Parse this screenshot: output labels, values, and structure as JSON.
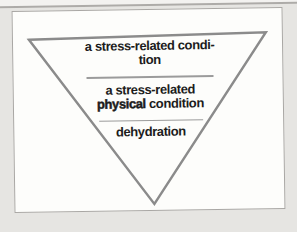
{
  "page": {
    "background_color": "#e6e5e2",
    "card_background": "#fdfdfb",
    "card_border_color": "#a9a7a4",
    "page_edge_color": "#adaba8"
  },
  "diagram": {
    "type": "inverted-triangle",
    "triangle_stroke_color": "#8b8b8b",
    "separator_color": "#9b9b9b",
    "text_color": "#1c1c1c",
    "levels": [
      {
        "name": "level-1",
        "line1": "a stress-related condi-",
        "line2": "tion"
      },
      {
        "name": "level-2",
        "line1": "a stress-related",
        "line2_bold": "physical",
        "line2_rest": " condition"
      },
      {
        "name": "level-3",
        "line1": "dehydration"
      }
    ]
  }
}
